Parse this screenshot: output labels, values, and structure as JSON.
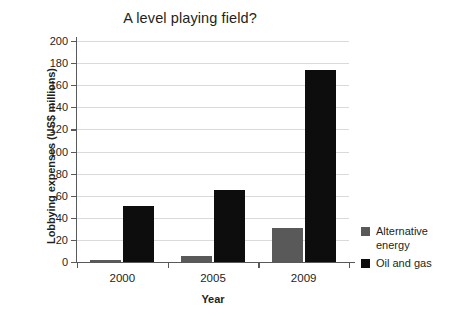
{
  "chart_data": {
    "type": "bar",
    "title": "A level playing field?",
    "xlabel": "Year",
    "ylabel": "Lobbying expenses (US$ millions)",
    "categories": [
      "2000",
      "2005",
      "2009"
    ],
    "series": [
      {
        "name": "Alternative energy",
        "color": "#595959",
        "values": [
          2,
          5,
          31
        ]
      },
      {
        "name": "Oil and gas",
        "color": "#0d0d0d",
        "values": [
          51,
          65,
          174
        ]
      }
    ],
    "ylim": [
      0,
      200
    ],
    "yticks": [
      0,
      20,
      40,
      60,
      80,
      100,
      120,
      140,
      160,
      180,
      200
    ],
    "ytick_labels": [
      "0",
      "20",
      "40",
      "60",
      "80",
      "100",
      "120",
      "140",
      "160",
      "180",
      "200"
    ],
    "grid": "horizontal",
    "legend_position": "right",
    "legend_entries": [
      "Alternative energy",
      "Oil and gas"
    ]
  }
}
